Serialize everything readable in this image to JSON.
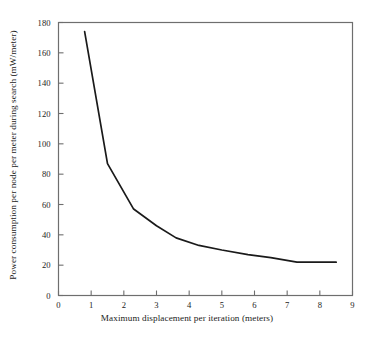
{
  "chart_data": {
    "type": "line",
    "title": "",
    "xlabel": "Maximum displacement per iteration (meters)",
    "ylabel": "Power consumption per node per meter during search (mW/meter)",
    "xlim": [
      0,
      9
    ],
    "ylim": [
      0,
      180
    ],
    "xticks": [
      0,
      1,
      2,
      3,
      4,
      5,
      6,
      7,
      8,
      9
    ],
    "xtick_labels": [
      "0",
      "1",
      "2",
      "3",
      "4",
      "5",
      "6",
      "7",
      "8",
      "9"
    ],
    "yticks": [
      0,
      20,
      40,
      60,
      80,
      100,
      120,
      140,
      160,
      180
    ],
    "ytick_labels": [
      "0",
      "20",
      "40",
      "60",
      "80",
      "100",
      "120",
      "140",
      "160",
      "180"
    ],
    "grid": false,
    "legend": null,
    "series": [
      {
        "name": "Power consumption",
        "color": "#1a1a1a",
        "x": [
          0.8,
          1.5,
          2.3,
          3.0,
          3.6,
          4.3,
          5.0,
          5.8,
          6.5,
          7.3,
          8.5
        ],
        "values": [
          174,
          87,
          57,
          46,
          38,
          33,
          30,
          27,
          25,
          22,
          22
        ]
      }
    ]
  },
  "axes": {
    "x_axis_label": "Maximum displacement per iteration (meters)",
    "y_axis_label": "Power consumption per node per meter during search (mW/meter)"
  }
}
